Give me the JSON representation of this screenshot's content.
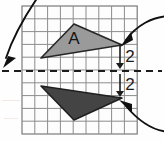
{
  "figure": {
    "background_color": "#fefefe"
  },
  "grid": {
    "x": 22,
    "y": 6,
    "cell": 12.8,
    "cols": 9,
    "rows": 10,
    "line_color": "#8c8c8c",
    "border_color": "#7a7a7a",
    "fill_color": "#fdfdfd"
  },
  "mirror_line": {
    "name": "mirror-line",
    "y": 71,
    "x_start": 2,
    "x_end": 162,
    "style": "dashed",
    "color": "#1c1c1c",
    "dash": "7 5",
    "width": 2.2
  },
  "shapes": [
    {
      "id": "triangle-a",
      "label": "A",
      "fill": "#9a9a9a",
      "stroke": "#262626",
      "stroke_width": 1.6,
      "points": "41,58 74,24 122,45",
      "label_x": 74,
      "label_y": 44,
      "label_color": "#141414",
      "label_size": 17
    },
    {
      "id": "triangle-image",
      "label": "",
      "fill": "#444444",
      "stroke": "#1f1f1f",
      "stroke_width": 1.6,
      "points": "41,86 74,120 122,98",
      "label_x": 0,
      "label_y": 0,
      "label_color": "#ffffff",
      "label_size": 17
    }
  ],
  "measurements": [
    {
      "id": "distance-above",
      "value": "2",
      "text_x": 130,
      "text_y": 62,
      "arrow_x": 120,
      "arrow_top": 46,
      "arrow_bottom": 69,
      "color": "#1c1c1c",
      "font_size": 17
    },
    {
      "id": "distance-below",
      "value": "2",
      "text_x": 130,
      "text_y": 90,
      "arrow_x": 120,
      "arrow_top": 74,
      "arrow_bottom": 97,
      "color": "#1c1c1c",
      "font_size": 17
    }
  ],
  "pointers": [
    {
      "id": "pointer-to-mirror-line",
      "path": "M 40 -6 C 26 14, 14 34, 6 58",
      "arrow_points": "3,68 16,58 8,56",
      "color": "#101010",
      "width": 1.9
    },
    {
      "id": "pointer-to-vertex-a",
      "path": "M 172 16 C 152 16, 136 26, 126 40",
      "arrow_points": "120,47 133,40 131,32",
      "color": "#101010",
      "width": 1.9
    },
    {
      "id": "pointer-to-vertex-image",
      "path": "M 172 132 C 152 132, 136 118, 126 106",
      "arrow_points": "119,100 132,104 132,113",
      "color": "#101010",
      "width": 1.9
    }
  ],
  "artifacts": {
    "note": "faint scanner marks at lower-left corner",
    "marks": [
      {
        "x": 2,
        "y": 100,
        "w": 18,
        "h": 1,
        "color": "#f0e8e4"
      },
      {
        "x": 4,
        "y": 118,
        "w": 14,
        "h": 1,
        "color": "#f2ebe7"
      }
    ]
  }
}
